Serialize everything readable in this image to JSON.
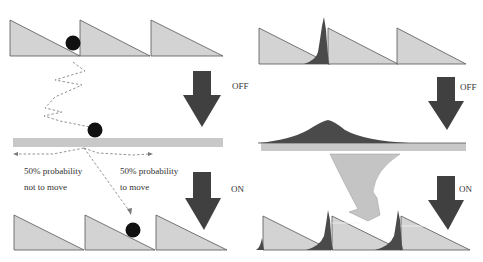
{
  "colors": {
    "sawtooth_fill": "#d3d3d3",
    "sawtooth_stroke": "#555555",
    "flat_bar": "#c8c8c8",
    "particle": "#111111",
    "arrow": "#404040",
    "distribution": "#4a4a4a",
    "curved_arrow": "#c4c4c4",
    "path": "#666666"
  },
  "left_panel": {
    "off_label": "OFF",
    "on_label": "ON",
    "left_text_line1": "50% probability",
    "left_text_line2": "not to move",
    "right_text_line1": "50% probability",
    "right_text_line2": "to move"
  },
  "right_panel": {
    "off_label": "OFF",
    "on_label": "ON"
  }
}
